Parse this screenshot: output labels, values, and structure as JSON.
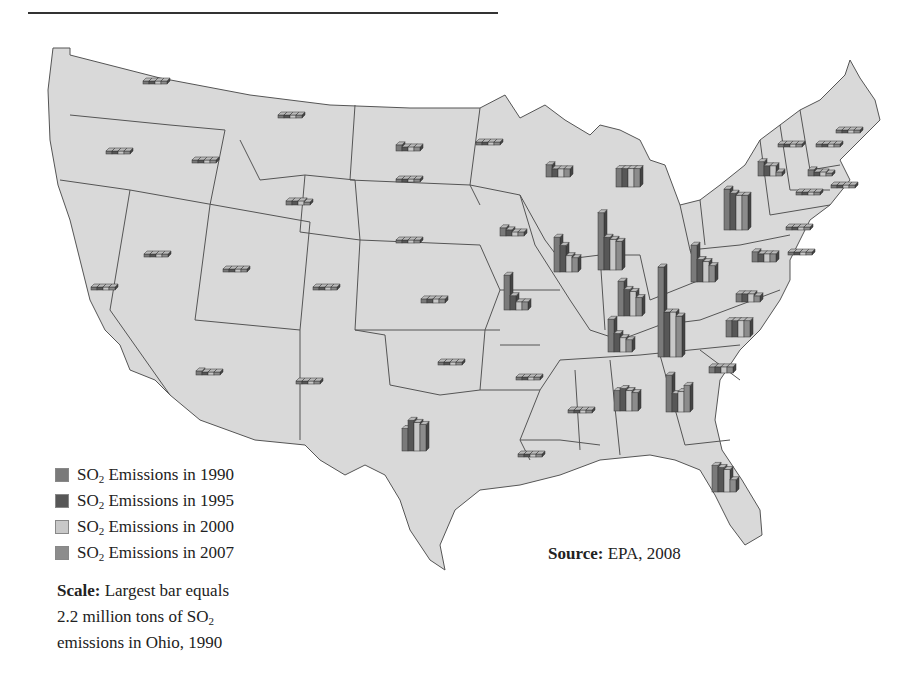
{
  "legend": {
    "items": [
      {
        "prefix": "SO",
        "sub": "2",
        "label": " Emissions in 1990",
        "color": "#7a7a7a"
      },
      {
        "prefix": "SO",
        "sub": "2",
        "label": " Emissions in 1995",
        "color": "#575757"
      },
      {
        "prefix": "SO",
        "sub": "2",
        "label": " Emissions in 2000",
        "color": "#c8c8c8"
      },
      {
        "prefix": "SO",
        "sub": "2",
        "label": " Emissions in 2007",
        "color": "#8c8c8c"
      }
    ]
  },
  "scale": {
    "label": "Scale:",
    "line1": " Largest bar equals",
    "line2a": "2.2 million tons of SO",
    "line2sub": "2",
    "line3": "emissions in Ohio, 1990"
  },
  "source": {
    "label": "Source:",
    "text": " EPA, 2008"
  },
  "chart_data": {
    "type": "bar",
    "series_names": [
      "1990",
      "1995",
      "2000",
      "2007"
    ],
    "scale_note": "Largest bar equals 2.2 million tons of SO2 emissions in Ohio, 1990",
    "units": "million tons (approx, estimated from bar heights)",
    "states": [
      {
        "state": "Ohio",
        "x": 672,
        "y": 357,
        "values": [
          2.2,
          1.1,
          1.1,
          1.0
        ]
      },
      {
        "state": "Indiana",
        "x": 612,
        "y": 270,
        "values": [
          1.4,
          0.8,
          0.75,
          0.7
        ]
      },
      {
        "state": "Pennsylvania",
        "x": 738,
        "y": 230,
        "values": [
          1.0,
          0.9,
          0.85,
          0.85
        ]
      },
      {
        "state": "Illinois",
        "x": 568,
        "y": 272,
        "values": [
          0.85,
          0.65,
          0.4,
          0.35
        ]
      },
      {
        "state": "Kentucky",
        "x": 632,
        "y": 316,
        "values": [
          0.85,
          0.65,
          0.6,
          0.45
        ]
      },
      {
        "state": "Tennessee",
        "x": 622,
        "y": 352,
        "values": [
          0.8,
          0.45,
          0.35,
          0.3
        ]
      },
      {
        "state": "Georgia",
        "x": 680,
        "y": 412,
        "values": [
          0.9,
          0.45,
          0.5,
          0.65
        ]
      },
      {
        "state": "West Virginia",
        "x": 705,
        "y": 282,
        "values": [
          0.9,
          0.55,
          0.5,
          0.4
        ]
      },
      {
        "state": "Missouri",
        "x": 518,
        "y": 310,
        "values": [
          0.85,
          0.35,
          0.2,
          0.2
        ]
      },
      {
        "state": "Michigan",
        "x": 630,
        "y": 187,
        "values": [
          0.45,
          0.45,
          0.45,
          0.45
        ]
      },
      {
        "state": "Alabama",
        "x": 628,
        "y": 411,
        "values": [
          0.5,
          0.55,
          0.5,
          0.45
        ]
      },
      {
        "state": "Texas",
        "x": 416,
        "y": 451,
        "values": [
          0.55,
          0.75,
          0.7,
          0.65
        ]
      },
      {
        "state": "Florida",
        "x": 726,
        "y": 492,
        "values": [
          0.65,
          0.6,
          0.55,
          0.3
        ]
      },
      {
        "state": "New York",
        "x": 772,
        "y": 176,
        "values": [
          0.35,
          0.25,
          0.25,
          0.1
        ]
      },
      {
        "state": "North Carolina",
        "x": 740,
        "y": 337,
        "values": [
          0.4,
          0.4,
          0.4,
          0.4
        ]
      },
      {
        "state": "Wisconsin",
        "x": 560,
        "y": 177,
        "values": [
          0.3,
          0.2,
          0.2,
          0.2
        ]
      },
      {
        "state": "Virginia",
        "x": 750,
        "y": 302,
        "values": [
          0.2,
          0.2,
          0.2,
          0.15
        ]
      },
      {
        "state": "Maryland",
        "x": 766,
        "y": 262,
        "values": [
          0.25,
          0.2,
          0.2,
          0.2
        ]
      },
      {
        "state": "Iowa",
        "x": 514,
        "y": 236,
        "values": [
          0.2,
          0.15,
          0.1,
          0.1
        ]
      },
      {
        "state": "North Dakota",
        "x": 410,
        "y": 151,
        "values": [
          0.15,
          0.1,
          0.1,
          0.1
        ]
      },
      {
        "state": "South Carolina",
        "x": 723,
        "y": 373,
        "values": [
          0.15,
          0.15,
          0.15,
          0.15
        ]
      },
      {
        "state": "Massachusetts",
        "x": 822,
        "y": 176,
        "values": [
          0.15,
          0.1,
          0.1,
          0.05
        ]
      },
      {
        "state": "Wyoming",
        "x": 300,
        "y": 205,
        "values": [
          0.1,
          0.1,
          0.1,
          0.05
        ]
      },
      {
        "state": "Arizona",
        "x": 210,
        "y": 375,
        "values": [
          0.1,
          0.05,
          0.05,
          0.05
        ]
      },
      {
        "state": "Kansas",
        "x": 435,
        "y": 303,
        "values": [
          0.1,
          0.1,
          0.1,
          0.1
        ]
      },
      {
        "state": "Oklahoma",
        "x": 452,
        "y": 365,
        "values": [
          0.05,
          0.05,
          0.05,
          0.05
        ]
      },
      {
        "state": "Arkansas",
        "x": 530,
        "y": 380,
        "values": [
          0.05,
          0.05,
          0.05,
          0.05
        ]
      },
      {
        "state": "Mississippi",
        "x": 582,
        "y": 413,
        "values": [
          0.05,
          0.05,
          0.05,
          0.05
        ]
      },
      {
        "state": "Louisiana",
        "x": 532,
        "y": 457,
        "values": [
          0.05,
          0.05,
          0.05,
          0.05
        ]
      },
      {
        "state": "Colorado",
        "x": 327,
        "y": 290,
        "values": [
          0.05,
          0.05,
          0.05,
          0.05
        ]
      },
      {
        "state": "New Mexico",
        "x": 310,
        "y": 384,
        "values": [
          0.05,
          0.05,
          0.05,
          0.05
        ]
      },
      {
        "state": "Nebraska",
        "x": 410,
        "y": 243,
        "values": [
          0.05,
          0.05,
          0.05,
          0.05
        ]
      },
      {
        "state": "South Dakota",
        "x": 410,
        "y": 182,
        "values": [
          0.05,
          0.05,
          0.05,
          0.05
        ]
      },
      {
        "state": "Minnesota",
        "x": 490,
        "y": 145,
        "values": [
          0.05,
          0.05,
          0.05,
          0.05
        ]
      },
      {
        "state": "Montana",
        "x": 292,
        "y": 118,
        "values": [
          0.05,
          0.05,
          0.05,
          0.05
        ]
      },
      {
        "state": "Washington",
        "x": 157,
        "y": 84,
        "values": [
          0.05,
          0.05,
          0.05,
          0.05
        ]
      },
      {
        "state": "Oregon",
        "x": 120,
        "y": 154,
        "values": [
          0.05,
          0.05,
          0.05,
          0.05
        ]
      },
      {
        "state": "Idaho",
        "x": 206,
        "y": 163,
        "values": [
          0.05,
          0.05,
          0.05,
          0.05
        ]
      },
      {
        "state": "Nevada",
        "x": 158,
        "y": 257,
        "values": [
          0.05,
          0.05,
          0.05,
          0.05
        ]
      },
      {
        "state": "Utah",
        "x": 237,
        "y": 272,
        "values": [
          0.05,
          0.05,
          0.05,
          0.05
        ]
      },
      {
        "state": "California",
        "x": 105,
        "y": 290,
        "values": [
          0.05,
          0.05,
          0.05,
          0.05
        ]
      },
      {
        "state": "Vermont",
        "x": 792,
        "y": 147,
        "values": [
          0.05,
          0.05,
          0.05,
          0.05
        ]
      },
      {
        "state": "Maine",
        "x": 850,
        "y": 133,
        "values": [
          0.05,
          0.05,
          0.05,
          0.05
        ]
      },
      {
        "state": "New Hampshire",
        "x": 830,
        "y": 147,
        "values": [
          0.05,
          0.05,
          0.05,
          0.05
        ]
      },
      {
        "state": "Connecticut",
        "x": 810,
        "y": 195,
        "values": [
          0.05,
          0.05,
          0.05,
          0.05
        ]
      },
      {
        "state": "Rhode Island",
        "x": 845,
        "y": 188,
        "values": [
          0.05,
          0.05,
          0.05,
          0.05
        ]
      },
      {
        "state": "New Jersey",
        "x": 800,
        "y": 230,
        "values": [
          0.05,
          0.05,
          0.05,
          0.05
        ]
      },
      {
        "state": "Delaware",
        "x": 802,
        "y": 255,
        "values": [
          0.05,
          0.05,
          0.05,
          0.05
        ]
      }
    ]
  }
}
